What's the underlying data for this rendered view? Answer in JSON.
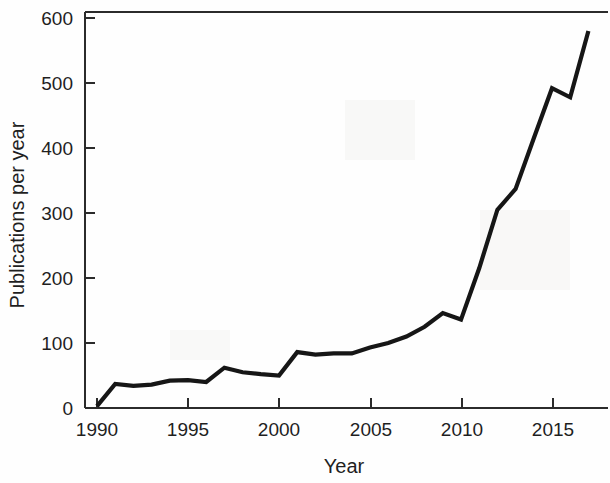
{
  "figure": {
    "background_color": "#fefefe",
    "line_color": "#161616",
    "axis_color": "#2b2b2b",
    "text_color": "#1f1f1f"
  },
  "chart_data": {
    "type": "line",
    "title": "",
    "subtitle": "",
    "xlabel": "Year",
    "ylabel": "Publications per year",
    "xlim": [
      1989.6,
      1990.0
    ],
    "ylim": [
      0,
      620
    ],
    "x_axis_min": 1989.6,
    "x_axis_max": 2017.8,
    "y_axis_min": 0,
    "y_axis_max": 620,
    "grid": false,
    "legend": false,
    "legend_position": "none",
    "marker": "none",
    "line_width": 4,
    "x_ticks": [
      1990,
      1995,
      2000,
      2005,
      2010,
      2015
    ],
    "x_tick_labels": [
      "1990",
      "1995",
      "2000",
      "2005",
      "2010",
      "2015"
    ],
    "y_ticks": [
      0,
      100,
      200,
      300,
      400,
      500,
      600
    ],
    "y_tick_labels": [
      "0",
      "100",
      "200",
      "300",
      "400",
      "500",
      "600"
    ],
    "x": [
      1990,
      1991,
      1992,
      1993,
      1994,
      1995,
      1996,
      1997,
      1998,
      1999,
      2000,
      2001,
      2002,
      2003,
      2004,
      2005,
      2006,
      2007,
      2008,
      2009,
      2010,
      2011,
      2012,
      2013,
      2014,
      2015,
      2016,
      2017
    ],
    "values": [
      3,
      37,
      34,
      36,
      42,
      43,
      40,
      62,
      55,
      52,
      50,
      86,
      82,
      84,
      84,
      93,
      100,
      110,
      125,
      146,
      136,
      215,
      305,
      337,
      415,
      492,
      478,
      580
    ],
    "series": [
      {
        "name": "Publications per year",
        "values": [
          3,
          37,
          34,
          36,
          42,
          43,
          40,
          62,
          55,
          52,
          50,
          86,
          82,
          84,
          84,
          93,
          100,
          110,
          125,
          146,
          136,
          215,
          305,
          337,
          415,
          492,
          478,
          580
        ]
      }
    ]
  }
}
